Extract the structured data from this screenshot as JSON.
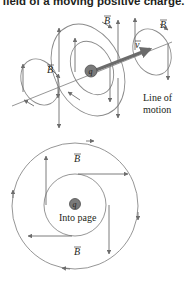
{
  "header": {
    "title": "field of a moving positive charge."
  },
  "diagram_top": {
    "charge_label": "q",
    "field_labels": [
      "B",
      "B",
      "B",
      "B"
    ],
    "velocity_label": "v",
    "line_label_1": "Line of",
    "line_label_2": "motion"
  },
  "diagram_bottom": {
    "charge_label": "q",
    "direction_label": "Into page",
    "field_label_top": "B",
    "field_label_bottom": "B"
  },
  "colors": {
    "field_line": "#8a8a8a",
    "arrow": "#6d6d6d",
    "velocity_arrow": "#6b6b6b",
    "charge_fill": "#7a7a7a",
    "text": "#231f20"
  }
}
